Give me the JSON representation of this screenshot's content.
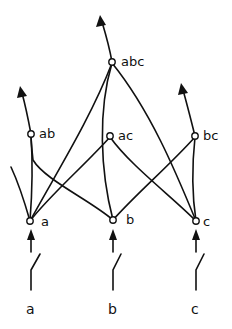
{
  "diagram": {
    "colors": {
      "stroke": "#111111",
      "background": "#ffffff"
    },
    "inputs": [
      {
        "id": "a",
        "label": "a"
      },
      {
        "id": "b",
        "label": "b"
      },
      {
        "id": "c",
        "label": "c"
      }
    ],
    "nodes": {
      "a": {
        "label": "a"
      },
      "b": {
        "label": "b"
      },
      "c": {
        "label": "c"
      },
      "ab": {
        "label": "ab"
      },
      "ac": {
        "label": "ac"
      },
      "bc": {
        "label": "bc"
      },
      "abc": {
        "label": "abc"
      }
    },
    "edges": [
      [
        "a",
        "ab"
      ],
      [
        "b",
        "ab"
      ],
      [
        "a",
        "ac"
      ],
      [
        "c",
        "ac"
      ],
      [
        "b",
        "bc"
      ],
      [
        "c",
        "bc"
      ],
      [
        "a",
        "abc"
      ],
      [
        "b",
        "abc"
      ],
      [
        "c",
        "abc"
      ]
    ],
    "outputs": [
      "ab",
      "bc",
      "abc"
    ]
  }
}
